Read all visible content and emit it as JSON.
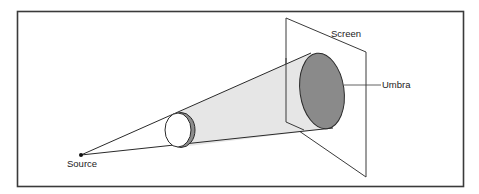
{
  "diagram": {
    "labels": {
      "source": "Source",
      "screen": "Screen",
      "umbra": "Umbra"
    },
    "colors": {
      "frame": "#3a3a3a",
      "cone_fill": "#e6e6e6",
      "umbra_fill": "#8a8a8a",
      "shadow_crescent": "#8c8c8c",
      "line": "#2a2a2a"
    }
  }
}
